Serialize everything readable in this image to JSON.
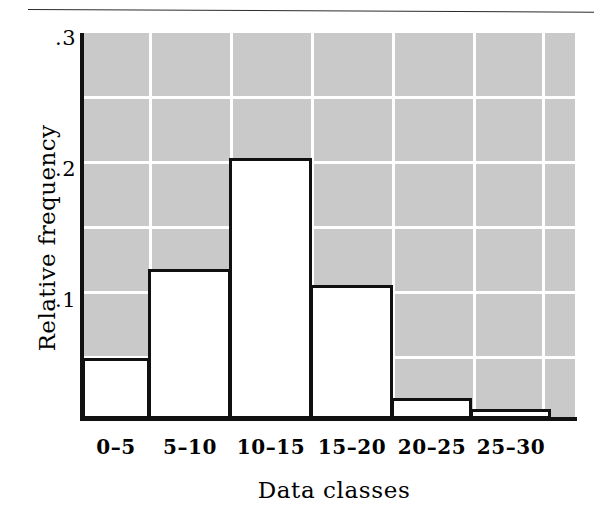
{
  "figure": {
    "background_color": "#ffffff",
    "plot_background_color": "#c9c9c9",
    "gridline_color": "#ffffff",
    "axis_color": "#111111",
    "bar_fill_color": "#ffffff",
    "bar_outline_color": "#101010"
  },
  "axes": {
    "y_title": "Relative frequency",
    "x_title": "Data classes",
    "y_ticks": [
      {
        "label": ".3",
        "value": 0.3
      },
      {
        "label": ".2",
        "value": 0.2
      },
      {
        "label": ".1",
        "value": 0.1
      }
    ]
  },
  "chart_data": {
    "type": "bar",
    "title": "",
    "subtitle": "",
    "xlabel": "Data classes",
    "ylabel": "Relative frequency",
    "categories": [
      "0–5",
      "5–10",
      "10–15",
      "15–20",
      "20–25",
      "25–30"
    ],
    "values": [
      0.047,
      0.115,
      0.2,
      0.103,
      0.016,
      0.008
    ],
    "series": [
      {
        "name": "Relative frequency",
        "values": [
          0.047,
          0.115,
          0.2,
          0.103,
          0.016,
          0.008
        ]
      }
    ],
    "ylim": [
      0,
      0.3
    ],
    "xlim": [
      0,
      6
    ],
    "y_tick_labels": [
      ".1",
      ".2",
      ".3"
    ],
    "y_tick_values": [
      0.1,
      0.2,
      0.3
    ],
    "y_minor_gridlines": [
      0.05,
      0.15,
      0.25
    ],
    "grid": true,
    "grid_orientation": "both",
    "legend": false,
    "legend_position": "none",
    "annotations": []
  }
}
